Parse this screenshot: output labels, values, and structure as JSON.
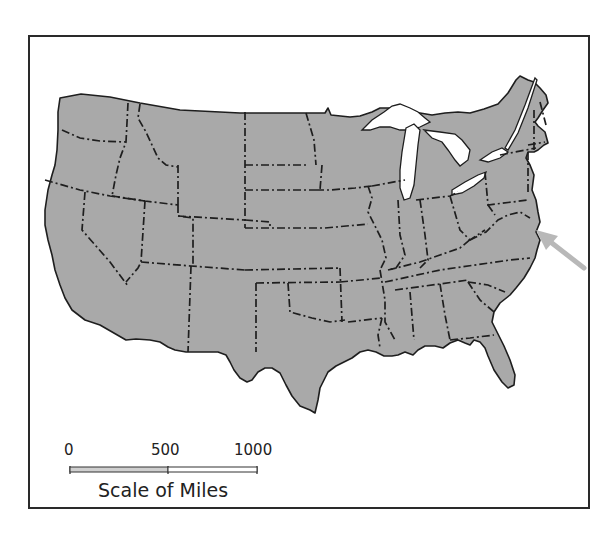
{
  "map": {
    "subject": "Contiguous United States",
    "land_color": "#a9a9a9",
    "border_color": "#1e1e1e",
    "water_color": "#ffffff",
    "arrow_color": "#b8b8b8",
    "arrow_target": "Delaware / Maryland Atlantic coast"
  },
  "scale": {
    "ticks": [
      "0",
      "500",
      "1000"
    ],
    "title": "Scale of Miles"
  }
}
